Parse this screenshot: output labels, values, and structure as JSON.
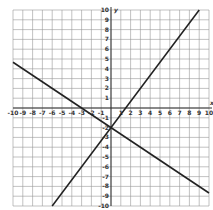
{
  "chart_data": {
    "type": "line",
    "title": "",
    "xlabel": "x",
    "ylabel": "y",
    "xlim": [
      -10,
      10
    ],
    "ylim": [
      -10,
      10
    ],
    "grid": true,
    "x_ticks": [
      -10,
      -9,
      -8,
      -7,
      -6,
      -5,
      -4,
      -3,
      -2,
      -1,
      1,
      2,
      3,
      4,
      5,
      6,
      7,
      8,
      9,
      10
    ],
    "y_ticks": [
      10,
      9,
      8,
      7,
      6,
      5,
      4,
      3,
      2,
      1,
      -1,
      -2,
      -3,
      -4,
      -5,
      -6,
      -7,
      -8,
      -9,
      -10
    ],
    "series": [
      {
        "name": "line-1",
        "equation": "y = 4/3 x - 2",
        "x": [
          -6,
          9
        ],
        "y": [
          -10,
          10
        ]
      },
      {
        "name": "line-2",
        "equation": "y = -2/3 x - 2",
        "x": [
          -10,
          10
        ],
        "y": [
          4.67,
          -8.67
        ]
      }
    ],
    "intersection": [
      0,
      -2
    ]
  },
  "labels": {
    "x_axis": "x",
    "y_axis": "y"
  }
}
